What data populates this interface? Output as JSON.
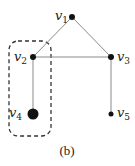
{
  "diagram": {
    "type": "graph",
    "caption": "(b)",
    "nodes": [
      {
        "id": "v1",
        "label": "v",
        "sub": "1",
        "x": 72,
        "y": 17,
        "r": 3
      },
      {
        "id": "v2",
        "label": "v",
        "sub": "2",
        "x": 33,
        "y": 57,
        "r": 3
      },
      {
        "id": "v3",
        "label": "v",
        "sub": "3",
        "x": 111,
        "y": 57,
        "r": 3
      },
      {
        "id": "v4",
        "label": "v",
        "sub": "4",
        "x": 33,
        "y": 114,
        "r": 5.5
      },
      {
        "id": "v5",
        "label": "v",
        "sub": "5",
        "x": 111,
        "y": 114,
        "r": 2.5
      }
    ],
    "edges": [
      [
        "v1",
        "v2"
      ],
      [
        "v1",
        "v3"
      ],
      [
        "v2",
        "v3"
      ],
      [
        "v2",
        "v4"
      ],
      [
        "v3",
        "v5"
      ]
    ],
    "highlight_group": {
      "members": [
        "v2",
        "v4"
      ],
      "style": "dashed-rounded-rect"
    },
    "colors": {
      "edge": "#8a8a8a",
      "node": "#111111",
      "text": "#222222"
    }
  }
}
